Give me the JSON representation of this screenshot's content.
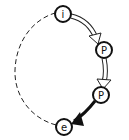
{
  "diagram": {
    "type": "cycle",
    "colors": {
      "stroke": "#111111",
      "background": "#ffffff",
      "hollow_arrow_fill": "#ffffff"
    },
    "nodes": [
      {
        "id": "i",
        "label": "i",
        "cx": 63,
        "cy": 14
      },
      {
        "id": "p1",
        "label": "P",
        "cx": 104,
        "cy": 50
      },
      {
        "id": "p2",
        "label": "P",
        "cx": 101,
        "cy": 95
      },
      {
        "id": "e",
        "label": "e",
        "cx": 64,
        "cy": 127
      }
    ],
    "edges": [
      {
        "from": "i",
        "to": "p1",
        "style": "hollow-arrow"
      },
      {
        "from": "p1",
        "to": "p2",
        "style": "hollow-arrow"
      },
      {
        "from": "p2",
        "to": "e",
        "style": "bold-solid-arrow"
      },
      {
        "from": "e",
        "to": "i",
        "style": "dashed-arc"
      }
    ]
  }
}
